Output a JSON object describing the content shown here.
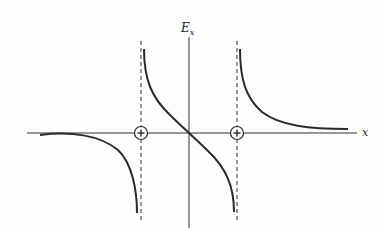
{
  "diagram": {
    "type": "field-plot",
    "axes": {
      "x_label": "x",
      "y_label": "E",
      "y_label_subscript": "x"
    },
    "charges": [
      {
        "sign": "+",
        "symbol": "+",
        "position": "left"
      },
      {
        "sign": "+",
        "symbol": "+",
        "position": "right"
      }
    ],
    "asymptotes": [
      "dashed vertical line through left charge",
      "dashed vertical line through right charge"
    ],
    "colors": {
      "line": "#2a2a2a",
      "background": "#fdfdfd"
    }
  }
}
